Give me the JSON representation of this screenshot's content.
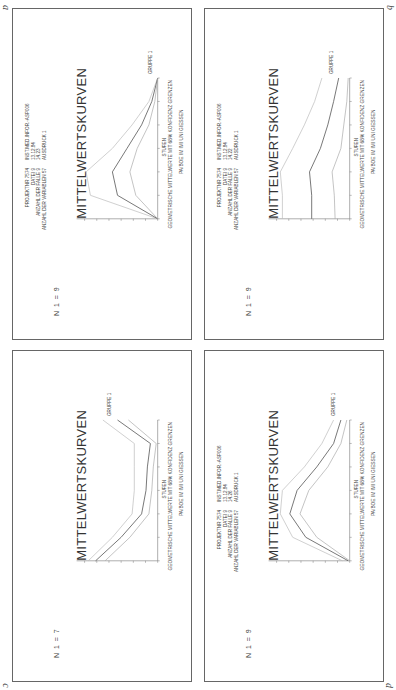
{
  "figure": {
    "panel_labels": [
      "a",
      "b",
      "c",
      "d"
    ]
  },
  "panels": [
    {
      "id": "a",
      "title": "MITTELWERTSKURVEN",
      "n_label": "N 1 = 9",
      "header_left": [
        "PROJEKTNR   7574",
        "DATEI   9",
        "ANZAHL DER FALLE   9",
        "ANZAHL DER VARIABLEN   57"
      ],
      "header_right": [
        "INST.MED.INFOR.-ASP006",
        "13.12.84",
        "14.23",
        "AUSDRUCK 1"
      ],
      "legend": "GRUPPE 1",
      "xlabel": "STUFEN",
      "footer1": "GEOMETRISCHE MITTELWERTE MIT 68% KONFIDENZ GRENZEN",
      "footer2": "PA/BOE IM IMI UNI GIESSEN"
    },
    {
      "id": "b",
      "title": "MITTELWERTSKURVEN",
      "n_label": "N 1 = 9",
      "header_left": [
        "PROJEKTNR   7574",
        "DATEI   9",
        "ANZAHL DER FALLE   9",
        "ANZAHL DER VARIABLEN   57"
      ],
      "header_right": [
        "INST.MED.INFOR.-ASP006",
        "13.12.84",
        "14.22",
        "AUSDRUCK 1"
      ],
      "legend": "GRUPPE 1",
      "xlabel": "STUFEN",
      "footer1": "GEOMETRISCHE MITTELWERTE MIT 68% KONFIDENZ GRENZEN",
      "footer2": "PA/BOE IM IMI UNI GIESSEN"
    },
    {
      "id": "c",
      "title": "MITTELWERTSKURVEN",
      "n_label": "N 1 = 7",
      "header_left": [],
      "header_right": [],
      "legend": "GRUPPE 1",
      "xlabel": "STUFEN",
      "footer1": "GEOMETRISCHE MITTELWERTE MIT 68% KONFIDENZ GRENZEN",
      "footer2": "PA/BOE IM IMI UNI GIESSEN"
    },
    {
      "id": "d",
      "title": "MITTELWERTSKURVEN",
      "n_label": "N 1 = 9",
      "header_left": [
        "PROJEKTNR   7574",
        "DATEI   9",
        "ANZAHL DER FALLE   9",
        "ANZAHL DER VARIABLEN   57"
      ],
      "header_right": [
        "INST.MED.INFOR.-ASP006",
        "13.12.84",
        "14.26",
        "AUSDRUCK 1"
      ],
      "legend": "GRUPPE 1",
      "xlabel": "STUFEN",
      "footer1": "GEOMETRISCHE MITTELWERTE MIT 68% KONFIDENZ GRENZEN",
      "footer2": "PA/BOE IM IMI UNI GIESSEN"
    }
  ],
  "chart_data": [
    {
      "panel": "a",
      "type": "line",
      "title": "MITTELWERTSKURVEN",
      "xlabel": "STUFEN",
      "ylabel": "",
      "x": [
        1,
        2,
        3,
        4,
        5,
        6,
        7
      ],
      "series": [
        {
          "name": "upper 68% limit",
          "values": [
            0.0,
            0.92,
            0.98,
            0.62,
            0.35,
            0.12,
            0.0
          ]
        },
        {
          "name": "GRUPPE 1 (geometric mean)",
          "values": [
            0.0,
            0.55,
            0.62,
            0.42,
            0.22,
            0.08,
            0.0
          ]
        },
        {
          "name": "lower 68% limit",
          "values": [
            0.0,
            0.3,
            0.38,
            0.28,
            0.12,
            0.04,
            0.0
          ]
        }
      ],
      "ylim": [
        0,
        1
      ],
      "grid": false,
      "legend_position": "end-of-line"
    },
    {
      "panel": "b",
      "type": "line",
      "title": "MITTELWERTSKURVEN",
      "xlabel": "STUFEN",
      "ylabel": "",
      "x": [
        1,
        2,
        3,
        4,
        5,
        6,
        7
      ],
      "series": [
        {
          "name": "upper 68% limit",
          "values": [
            0.92,
            0.92,
            0.95,
            0.78,
            0.62,
            0.48,
            0.38
          ]
        },
        {
          "name": "GRUPPE 1 (geometric mean)",
          "values": [
            0.52,
            0.52,
            0.55,
            0.4,
            0.3,
            0.22,
            0.15
          ]
        },
        {
          "name": "lower 68% limit",
          "values": [
            0.2,
            0.21,
            0.24,
            0.12,
            0.08,
            0.04,
            0.02
          ]
        }
      ],
      "ylim": [
        0,
        1
      ],
      "grid": false,
      "legend_position": "end-of-line"
    },
    {
      "panel": "c",
      "type": "line",
      "title": "MITTELWERTSKURVEN",
      "xlabel": "STUFEN",
      "ylabel": "",
      "x": [
        1,
        2,
        3,
        4,
        5,
        6,
        7
      ],
      "series": [
        {
          "name": "upper 68% limit",
          "values": [
            0.95,
            0.62,
            0.35,
            0.32,
            0.32,
            0.32,
            0.75
          ]
        },
        {
          "name": "GRUPPE 1 (geometric mean)",
          "values": [
            0.85,
            0.5,
            0.22,
            0.16,
            0.14,
            0.1,
            0.55
          ]
        },
        {
          "name": "lower 68% limit",
          "values": [
            0.72,
            0.38,
            0.12,
            0.08,
            0.06,
            0.02,
            0.4
          ]
        }
      ],
      "ylim": [
        0,
        1
      ],
      "grid": false,
      "legend_position": "end-of-line"
    },
    {
      "panel": "d",
      "type": "line",
      "title": "MITTELWERTSKURVEN",
      "xlabel": "STUFEN",
      "ylabel": "",
      "x": [
        1,
        2,
        3,
        4,
        5,
        6,
        7
      ],
      "series": [
        {
          "name": "upper 68% limit",
          "values": [
            0.1,
            0.78,
            0.95,
            0.92,
            0.62,
            0.38,
            0.22
          ]
        },
        {
          "name": "GRUPPE 1 (geometric mean)",
          "values": [
            0.02,
            0.6,
            0.82,
            0.72,
            0.45,
            0.22,
            0.12
          ]
        },
        {
          "name": "lower 68% limit",
          "values": [
            0.0,
            0.45,
            0.68,
            0.56,
            0.3,
            0.12,
            0.04
          ]
        }
      ],
      "ylim": [
        0,
        1
      ],
      "grid": false,
      "legend_position": "end-of-line"
    }
  ]
}
